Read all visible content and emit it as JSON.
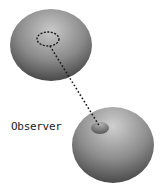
{
  "diagram": {
    "label": "Observer",
    "colors": {
      "sphere_light": "#d8d8d8",
      "sphere_dark": "#4a4a4a",
      "dash": "#1a1a1a",
      "spot": "#6e6e6e"
    },
    "nodes": [
      {
        "id": "top-sphere",
        "cx": 51,
        "cy": 45,
        "rx": 41,
        "ry": 36
      },
      {
        "id": "bottom-sphere",
        "cx": 113,
        "cy": 145,
        "rx": 41,
        "ry": 38
      }
    ],
    "markers": [
      {
        "id": "dashed-ellipse",
        "cx": 48,
        "cy": 39,
        "rx": 11,
        "ry": 7
      },
      {
        "id": "observer-spot",
        "cx": 100,
        "cy": 128,
        "rx": 9,
        "ry": 6
      }
    ],
    "connector": {
      "x1": 50,
      "y1": 46,
      "x2": 100,
      "y2": 127,
      "style": "dotted"
    }
  }
}
